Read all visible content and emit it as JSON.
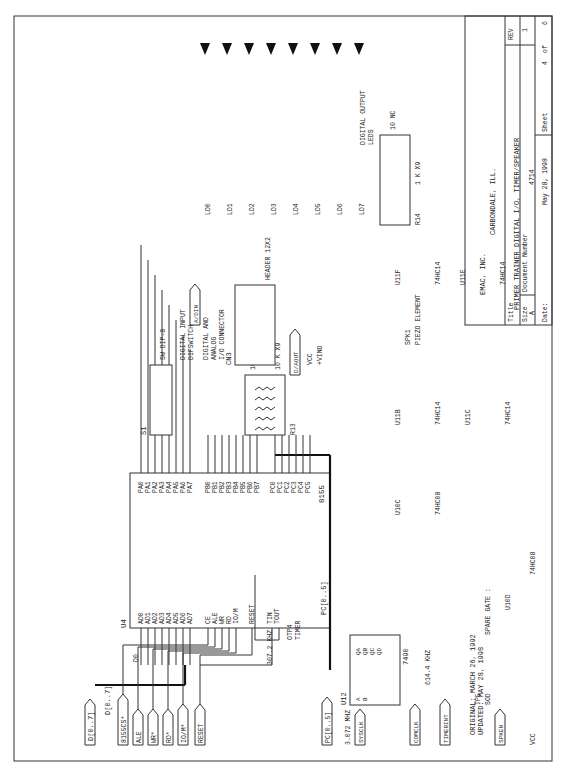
{
  "title_block": {
    "company": "EMAC, INC.",
    "city": "CARBONDALE, ILL.",
    "title_label": "Title",
    "title": "PRIMER TRAINER DIGITAL I/O, TIMER/SPEAKER",
    "size_label": "Size",
    "size": "A",
    "docnum_label": "Document Number",
    "docnum": "4714",
    "rev_label": "REV",
    "rev": "1",
    "date_label": "Date:",
    "date": "May 28, 1998",
    "sheet_label": "Sheet",
    "sheet": "4",
    "of_label": "of",
    "sheets": "6"
  },
  "notes": {
    "original": "ORIGINAL: MARCH 26, 1992",
    "updated": "UPDATED: MAY 28, 1998",
    "spare_gate": "SPARE GATE :",
    "digital_output": "DIGITAL OUTPUT",
    "leds": "LEDS",
    "digital_input": "DIGITAL INPUT",
    "dipswitch": "DIPSWITCH",
    "dig_analog1": "DIGITAL AND",
    "dig_analog2": "ANALOG",
    "io_conn": "I/O CONNECTOR",
    "freq1": "307.2 KHZ",
    "freq2": "3.072 MHZ",
    "freq3": "614.4 KHZ",
    "timer": "TIMER",
    "otp4": "OTP4",
    "tp5": "TP5",
    "sod": "SOD",
    "vcc": "VCC",
    "vino": "+VINO",
    "piezo": "PIEZO ELEMENT",
    "spk1": "SPK1"
  },
  "u4": {
    "ref": "U4",
    "part": "8155",
    "left_pins": [
      "AD0",
      "AD1",
      "AD2",
      "AD3",
      "AD4",
      "AD5",
      "AD6",
      "AD7",
      "",
      "CE",
      "ALE",
      "WR",
      "RD",
      "IO/M",
      "",
      "RESET",
      "",
      "TIN",
      "TOUT"
    ],
    "left_nums": [
      "12",
      "13",
      "14",
      "15",
      "16",
      "17",
      "18",
      "19",
      "",
      "8",
      "11",
      "10",
      "9",
      "7",
      "",
      "4",
      "",
      "3",
      "6"
    ],
    "d_labels": [
      "D0",
      "D1",
      "D2",
      "D3",
      "D4",
      "D5",
      "D6",
      "D7"
    ],
    "right_pins": [
      "PA0",
      "PA1",
      "PA2",
      "PA3",
      "PA4",
      "PA5",
      "PA6",
      "PA7",
      "",
      "PB0",
      "PB1",
      "PB2",
      "PB3",
      "PB4",
      "PB5",
      "PB6",
      "PB7",
      "",
      "PC0",
      "PC1",
      "PC2",
      "PC3",
      "PC4",
      "PC5"
    ],
    "right_nums": [
      "21",
      "22",
      "23",
      "24",
      "25",
      "26",
      "27",
      "28",
      "",
      "29",
      "30",
      "31",
      "32",
      "33",
      "34",
      "35",
      "36",
      "",
      "37",
      "38",
      "39",
      "1",
      "2",
      "5"
    ]
  },
  "ports": {
    "bus_d": "D[0..7]",
    "bus_d_lbl": "D[0..7]",
    "cs": "8155CS*",
    "ale": "ALE",
    "wr": "WR*",
    "rd": "RD*",
    "iom": "IO/M*",
    "reset": "RESET",
    "pc": "PC[0..5]",
    "pc_lbl": "PC[0..5]",
    "sysclk": "SYSCLK",
    "comclk": "COMCLK",
    "timerint": "TIMERINT",
    "spken": "SPKEN",
    "adin": "A/DIN",
    "daout": "D/AOUT"
  },
  "u12": {
    "ref": "U12",
    "part": "7490",
    "left": [
      "A",
      "B",
      "",
      "R0(1)",
      "R0(2)",
      "R9(1)",
      "R9(2)"
    ],
    "left_nums": [
      "14",
      "1",
      "",
      "2",
      "3",
      "6",
      "7"
    ],
    "right": [
      "QA",
      "QB",
      "QC",
      "QD"
    ],
    "right_nums": [
      "12",
      "9",
      "8",
      "11"
    ],
    "nc": [
      "NC",
      "NC"
    ]
  },
  "r13": {
    "ref": "R13",
    "value": "10 K X9",
    "pins": [
      "10 NC",
      "9",
      "8",
      "7",
      "6",
      "5",
      "4",
      "3",
      "2",
      "1"
    ],
    "vcc": "VCC"
  },
  "r14": {
    "ref": "R14",
    "value": "1 K X9",
    "pins": [
      "2",
      "3",
      "4",
      "5",
      "6",
      "7",
      "8",
      "9",
      "10 NC"
    ],
    "pin1": "1"
  },
  "s1": {
    "ref": "S1",
    "part": "SW DIP-8",
    "top": [
      "16",
      "15",
      "14",
      "13",
      "12",
      "11",
      "10",
      "9"
    ],
    "bottom": [
      "1",
      "2",
      "3",
      "4",
      "5",
      "6",
      "7",
      "8"
    ]
  },
  "cn3": {
    "ref": "CN3",
    "part": "HEADER 12X2",
    "odd": [
      "1",
      "3",
      "5",
      "7",
      "9",
      "11",
      "13",
      "15",
      "17",
      "19",
      "21",
      "23"
    ],
    "even": [
      "2",
      "4",
      "6",
      "8",
      "10",
      "12",
      "14",
      "16",
      "18",
      "20",
      "22",
      "24"
    ]
  },
  "leds": {
    "refs": [
      "LD0",
      "LD1",
      "LD2",
      "LD3",
      "LD4",
      "LD5",
      "LD6",
      "LD7"
    ],
    "nums": [
      "0",
      "1",
      "2",
      "3",
      "4",
      "5",
      "6",
      "7"
    ]
  },
  "gates": {
    "u11b": {
      "ref": "U11B",
      "part": "74HC14",
      "in": "3",
      "out": "4"
    },
    "u11c": {
      "ref": "U11C",
      "part": "74HC14",
      "in": "5",
      "out": "6"
    },
    "u11f": {
      "ref": "U11F",
      "part": "74HC14",
      "in": "13",
      "out": "12"
    },
    "u11e": {
      "ref": "U11E",
      "part": "74HC14",
      "in": "11",
      "out": "10"
    },
    "u10c": {
      "ref": "U10C",
      "part": "74HC08",
      "in1": "10",
      "in2": "9",
      "out": "8"
    },
    "u10d": {
      "ref": "U10D",
      "part": "74HC08",
      "in1": "12",
      "in2": "13",
      "out": "11 NC"
    }
  }
}
